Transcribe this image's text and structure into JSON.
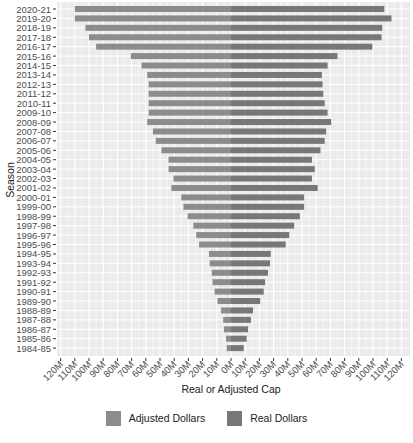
{
  "chart_data": {
    "type": "bar",
    "orientation": "horizontal",
    "layout": "diverging (population-pyramid style)",
    "title": "",
    "xlabel": "Real or Adjusted Cap",
    "ylabel": "Season",
    "xlim": [
      -120,
      120
    ],
    "x_unit": "M",
    "x_tick_labels": [
      "120M",
      "110M",
      "100M",
      "90M",
      "80M",
      "70M",
      "60M",
      "50M",
      "40M",
      "30M",
      "20M",
      "10M",
      "0M",
      "10M",
      "20M",
      "30M",
      "40M",
      "50M",
      "60M",
      "70M",
      "80M",
      "90M",
      "100M",
      "110M",
      "120M"
    ],
    "x_ticks": [
      -120,
      -110,
      -100,
      -90,
      -80,
      -70,
      -60,
      -50,
      -40,
      -30,
      -20,
      -10,
      0,
      10,
      20,
      30,
      40,
      50,
      60,
      70,
      80,
      90,
      100,
      110,
      120
    ],
    "grid": true,
    "legend_position": "bottom",
    "categories": [
      "2020-21",
      "2019-20",
      "2018-19",
      "2017-18",
      "2016-17",
      "2015-16",
      "2014-15",
      "2013-14",
      "2012-13",
      "2011-12",
      "2010-11",
      "2009-10",
      "2008-09",
      "2007-08",
      "2006-07",
      "2005-06",
      "2004-05",
      "2003-04",
      "2002-03",
      "2001-02",
      "2000-01",
      "1999-00",
      "1998-99",
      "1997-98",
      "1996-97",
      "1995-96",
      "1994-95",
      "1993-94",
      "1992-93",
      "1991-92",
      "1990-91",
      "1989-90",
      "1988-89",
      "1987-88",
      "1986-87",
      "1985-86",
      "1984-85"
    ],
    "series": [
      {
        "name": "Adjusted Dollars",
        "side": "left",
        "color": "#8c8c8c",
        "values": [
          110,
          110,
          102.5,
          100,
          95,
          70.5,
          63,
          59,
          58,
          58,
          58,
          58,
          59,
          55,
          53,
          49,
          44,
          44,
          40.5,
          42,
          35,
          33.5,
          30.5,
          26.5,
          24.5,
          22.5,
          15.5,
          15,
          13.5,
          13,
          11.5,
          9.5,
          7,
          5.5,
          5,
          3.5,
          3
        ]
      },
      {
        "name": "Real Dollars",
        "side": "right",
        "color": "#777777",
        "values": [
          108,
          113,
          106.5,
          106,
          99.5,
          75,
          68,
          64,
          64.5,
          65,
          66,
          68,
          70.5,
          67,
          66,
          63,
          57,
          59,
          57,
          61,
          51.5,
          51.5,
          48.5,
          44.5,
          41,
          38.5,
          28,
          27.5,
          26,
          24,
          23,
          20.5,
          15.5,
          14,
          12,
          11,
          9
        ]
      }
    ]
  },
  "legend": {
    "items": [
      {
        "label": "Adjusted Dollars",
        "color": "#8c8c8c"
      },
      {
        "label": "Real Dollars",
        "color": "#777777"
      }
    ]
  }
}
